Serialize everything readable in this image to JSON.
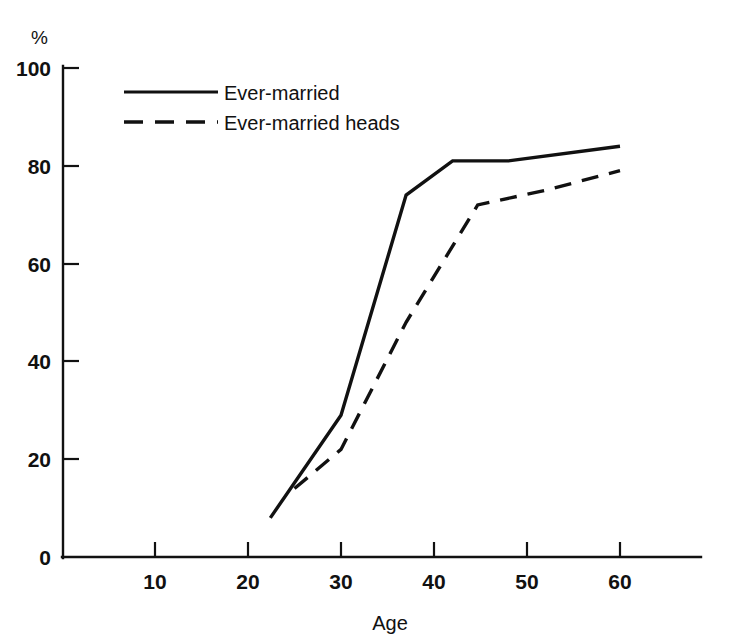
{
  "chart_data": {
    "type": "line",
    "title": "",
    "subtitle": "",
    "xlabel": "Age",
    "ylabel": "",
    "unit_label": "%",
    "xlim": [
      0,
      68.6
    ],
    "ylim": [
      0,
      100
    ],
    "grid": false,
    "xticks": [
      10,
      20,
      30,
      40,
      50,
      60
    ],
    "xtick_labels": [
      "10",
      "20",
      "30",
      "40",
      "50",
      "60"
    ],
    "yticks": [
      0,
      20,
      40,
      60,
      80,
      100
    ],
    "ytick_labels": [
      "0",
      "20",
      "40",
      "60",
      "80",
      "100"
    ],
    "legend_position": "upper-left-inside",
    "series": [
      {
        "name": "Ever-married",
        "style": "solid",
        "color": "#111111",
        "x": [
          22.4,
          30.0,
          37.0,
          42.0,
          48.0,
          60.0
        ],
        "values": [
          8,
          29,
          74,
          81,
          81,
          84
        ]
      },
      {
        "name": "Ever-married heads",
        "style": "dashed",
        "color": "#111111",
        "x": [
          25.0,
          30.0,
          37.0,
          44.7,
          52.0,
          60.0
        ],
        "values": [
          14,
          22,
          48,
          72,
          75,
          79
        ]
      }
    ]
  },
  "legend": {
    "entries": [
      {
        "label": "Ever-married",
        "style": "solid"
      },
      {
        "label": "Ever-married heads",
        "style": "dashed"
      }
    ]
  },
  "axes": {
    "y_unit": "%",
    "x_title": "Age"
  }
}
